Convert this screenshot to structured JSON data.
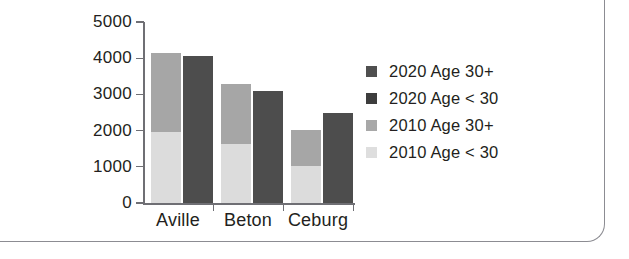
{
  "chart_data": {
    "type": "bar",
    "subtype": "stacked-grouped",
    "title": "",
    "xlabel": "",
    "ylabel": "",
    "categories": [
      "Aville",
      "Beton",
      "Ceburg"
    ],
    "yticks": [
      0,
      1000,
      2000,
      3000,
      4000,
      5000
    ],
    "ylim": [
      0,
      5000
    ],
    "grid": false,
    "legend_position": "right",
    "groups": [
      {
        "name": "2010",
        "series": [
          {
            "name": "2010 Age < 30",
            "color": "#dcdcdc",
            "values": [
              1950,
              1640,
              1030
            ]
          },
          {
            "name": "2010 Age 30+",
            "color": "#a6a6a6",
            "values": [
              2200,
              1660,
              990
            ]
          }
        ],
        "totals": [
          4150,
          3300,
          2020
        ]
      },
      {
        "name": "2020",
        "series": [
          {
            "name": "2020 Age < 30",
            "color": "#4d4d4d",
            "values": [
              4050,
              3100,
              2500
            ]
          },
          {
            "name": "2020 Age 30+",
            "color": "#595959",
            "values": [
              0,
              0,
              0
            ]
          }
        ],
        "totals": [
          4050,
          3100,
          2500
        ]
      }
    ],
    "legend": [
      {
        "label": "2020 Age 30+",
        "color": "#4f4f4f"
      },
      {
        "label": "2020 Age < 30",
        "color": "#3d3d3d"
      },
      {
        "label": "2010 Age 30+",
        "color": "#a8a8a8"
      },
      {
        "label": "2010 Age < 30",
        "color": "#dedede"
      }
    ]
  }
}
